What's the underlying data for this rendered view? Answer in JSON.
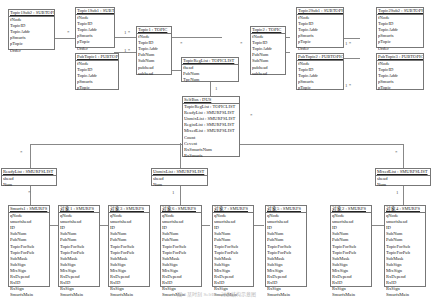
{
  "boxes": {
    "topic1sub2": {
      "title": "Topic1Sub2 : SUBTOPIC",
      "attrs": [
        "fNode",
        "TopicID",
        "TopicAddr",
        "pSmurfs",
        "pTopic",
        "Order"
      ]
    },
    "topic1sub1": {
      "title": "Topic1Sub1 : SUBTOPIC",
      "attrs": [
        "fNode",
        "TopicID",
        "TopicAddr",
        "pSmurfs",
        "pTopic",
        "Order"
      ]
    },
    "pubtopic1": {
      "title": "PubTopic1 : PUBTOPIC",
      "attrs": [
        "fNode",
        "TopicID",
        "TopicAddr",
        "pSmurfs",
        "pTopic"
      ]
    },
    "topic1": {
      "title": "Topic1 : TOPIC",
      "attrs": [
        "fNode",
        "TopicID",
        "TopicAddr",
        "PubNum",
        "SubNum",
        "pubhead",
        "subhead"
      ]
    },
    "topicreglist": {
      "title": "TopicRegList : TOPICLIST",
      "attrs": [
        "fhead",
        "PubNum",
        "TpcNum"
      ]
    },
    "topic2": {
      "title": "Topic2 : TOPIC",
      "attrs": [
        "fNode",
        "TopicID",
        "TopicAddr",
        "PubNum",
        "SubNum",
        "pubhead",
        "subhead"
      ]
    },
    "topic2sub1": {
      "title": "Topic2Sub1 : SUBTOPIC",
      "attrs": [
        "fNode",
        "TopicID",
        "TopicAddr",
        "pSmurfs",
        "pTopic",
        "Order"
      ]
    },
    "topic2sub2": {
      "title": "Topic2Sub2 : SUBTOPIC",
      "attrs": [
        "fNode",
        "TopicID",
        "TopicAddr",
        "pSmurfs",
        "pTopic",
        "Order"
      ]
    },
    "pubtopic2": {
      "title": "PubTopic2 : PUBTOPIC",
      "attrs": [
        "fNode",
        "TopicID",
        "TopicAddr",
        "pSmurfs",
        "pTopic"
      ]
    },
    "pubtopic3": {
      "title": "PubTopic3 : PUBTOPIC",
      "attrs": [
        "fNode",
        "TopicID",
        "TopicAddr",
        "pSmurfs",
        "pTopic"
      ]
    },
    "selfbus": {
      "title": "SelfBus : DUS",
      "attrs": [
        "TopicRegList : TOPICLIST",
        "ReadyList : SMURFSLIST",
        "UnmixList : SMURFSLIST",
        "RegistList : SMURFSLIST",
        "MixedList : SMURFSLIST",
        "Count",
        "Cevent",
        "RxSmurfsNum",
        "RxSmurfs"
      ]
    },
    "readylist": {
      "title": "ReadyList : SMURFSLIST",
      "attrs": [
        "shead",
        "Num"
      ]
    },
    "unmixlist": {
      "title": "UnmixList : SMURFSLIST",
      "attrs": [
        "shead",
        "Num"
      ]
    },
    "mixedlist": {
      "title": "MixedList : SMURFSLIST",
      "attrs": [
        "shead",
        "Num"
      ]
    },
    "smurfs": [
      {
        "title": "Smurfs1 : SMURFS"
      },
      {
        "title": "对象1 : SMURFS"
      },
      {
        "title": "对象3 : SMURFS"
      },
      {
        "title": "对象6 : SMURFS"
      },
      {
        "title": "对象7 : SMURFS"
      },
      {
        "title": "对象5 : SMURFS"
      },
      {
        "title": "对象2 : SMURFS"
      },
      {
        "title": "对象4 : SMURFS"
      }
    ],
    "smurfs_attrs": [
      "qNode",
      "smurfshead",
      "ID",
      "SubNum",
      "PubNum",
      "TopicForSub",
      "TopicForPub",
      "SubMask",
      "SubSign",
      "MixSign",
      "RxDepend",
      "RxID",
      "RxSign",
      "SmurfsMain"
    ]
  },
  "multiplicities": {
    "one": "1",
    "many": "*",
    "pair": "1  *"
  },
  "caption": "图 3 某时刻 SelfBus 对象结构示意图"
}
